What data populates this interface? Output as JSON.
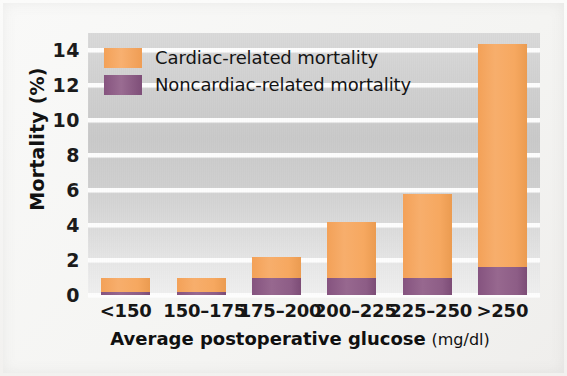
{
  "chart_data": {
    "type": "bar",
    "stacked": true,
    "title": "",
    "xlabel": "Average postoperative glucose (mg/dl)",
    "xlabel_main": "Average postoperative glucose",
    "xlabel_unit": "(mg/dl)",
    "ylabel": "Mortality (%)",
    "ylim": [
      0,
      15
    ],
    "yticks": [
      0,
      2,
      4,
      6,
      8,
      10,
      12,
      14
    ],
    "ytick_labels": [
      "0",
      "2",
      "4",
      "6",
      "8",
      "10",
      "12",
      "14"
    ],
    "grid": true,
    "legend_position": "top-left",
    "categories": [
      "<150",
      "150–175",
      "175–200",
      "200–225",
      "225–250",
      ">250"
    ],
    "series": [
      {
        "name": "Noncardiac-related mortality",
        "color": "#8B5A84",
        "values": [
          0.15,
          0.15,
          1.0,
          1.0,
          1.0,
          1.6
        ]
      },
      {
        "name": "Cardiac-related mortality",
        "color": "#F4A45D",
        "values": [
          0.85,
          0.85,
          1.2,
          3.2,
          4.8,
          12.8
        ]
      }
    ],
    "totals": [
      1.0,
      1.0,
      2.2,
      4.2,
      5.8,
      14.4
    ]
  },
  "legend": {
    "items": [
      {
        "label": "Cardiac-related mortality",
        "color": "#F4A45D"
      },
      {
        "label": "Noncardiac-related mortality",
        "color": "#8B5A84"
      }
    ]
  },
  "axes": {
    "y_title": "Mortality (%)",
    "x_title_main": "Average postoperative glucose",
    "x_title_unit": "(mg/dl)"
  },
  "colors": {
    "cardiac": "#F4A45D",
    "noncardiac": "#8B5A84",
    "plot_background": "#CFCFCF",
    "gridline": "#FDFDFD",
    "page_background": "#F4F4F2",
    "text": "#121212"
  }
}
